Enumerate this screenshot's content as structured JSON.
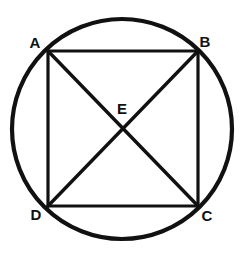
{
  "figure": {
    "kind": "geometry-diagram",
    "background_color": "#ffffff",
    "stroke_color": "#111111",
    "label_color": "#111111",
    "canvas": {
      "width": 247,
      "height": 256
    },
    "circle": {
      "name": "circumscribed-circle",
      "cx": 122,
      "cy": 129,
      "r": 110,
      "stroke_width": 4.2
    },
    "square": {
      "name": "inscribed-square",
      "stroke_width": 3.2,
      "sides": [
        {
          "name": "side-ab",
          "x1": 48,
          "y1": 51,
          "x2": 198,
          "y2": 51
        },
        {
          "name": "side-bc",
          "x1": 198,
          "y1": 51,
          "x2": 198,
          "y2": 206
        },
        {
          "name": "side-cd",
          "x1": 198,
          "y1": 206,
          "x2": 48,
          "y2": 206
        },
        {
          "name": "side-da",
          "x1": 48,
          "y1": 206,
          "x2": 48,
          "y2": 51
        }
      ]
    },
    "diagonals": {
      "stroke_width": 3.4,
      "lines": [
        {
          "name": "diagonal-ac",
          "x1": 48,
          "y1": 51,
          "x2": 198,
          "y2": 206
        },
        {
          "name": "diagonal-bd",
          "x1": 198,
          "y1": 51,
          "x2": 48,
          "y2": 206
        }
      ]
    },
    "points": [
      {
        "id": "A",
        "label": "A",
        "px": 48,
        "py": 51,
        "label_x": 35,
        "label_y": 42
      },
      {
        "id": "B",
        "label": "B",
        "px": 198,
        "py": 51,
        "label_x": 205,
        "label_y": 41
      },
      {
        "id": "C",
        "label": "C",
        "px": 198,
        "py": 206,
        "label_x": 207,
        "label_y": 215
      },
      {
        "id": "D",
        "label": "D",
        "px": 48,
        "py": 206,
        "label_x": 36,
        "label_y": 214
      },
      {
        "id": "E",
        "label": "E",
        "px": 123,
        "py": 128,
        "label_x": 122,
        "label_y": 108
      }
    ]
  }
}
